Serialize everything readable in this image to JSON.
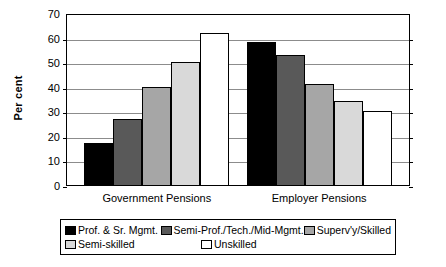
{
  "chart_data": {
    "type": "bar",
    "title": "",
    "xlabel": "",
    "ylabel": "Per cent",
    "ylim": [
      0,
      70
    ],
    "ytick_step": 10,
    "yticks": [
      0,
      10,
      20,
      30,
      40,
      50,
      60,
      70
    ],
    "grid": true,
    "legend_position": "bottom",
    "categories": [
      "Government Pensions",
      "Employer Pensions"
    ],
    "series": [
      {
        "name": "Prof. & Sr. Mgmt.",
        "color": "#000000",
        "values": [
          17,
          58
        ]
      },
      {
        "name": "Semi-Prof./Tech./Mid-Mgmt.",
        "color": "#595959",
        "values": [
          27,
          53
        ]
      },
      {
        "name": "Superv'y/Skilled",
        "color": "#a6a6a6",
        "values": [
          40,
          41
        ]
      },
      {
        "name": "Semi-skilled",
        "color": "#d9d9d9",
        "values": [
          50,
          34
        ]
      },
      {
        "name": "Unskilled",
        "color": "#ffffff",
        "values": [
          62,
          30
        ]
      }
    ]
  },
  "axis": {
    "y_title": "Per cent",
    "tick_labels": [
      "70",
      "60",
      "50",
      "40",
      "30",
      "20",
      "10",
      "0"
    ]
  },
  "x_axis": {
    "labels": [
      "Government Pensions",
      "Employer Pensions"
    ]
  },
  "legend": {
    "items": [
      "Prof. & Sr. Mgmt.",
      "Semi-Prof./Tech./Mid-Mgmt.",
      "Superv'y/Skilled",
      "Semi-skilled",
      "Unskilled"
    ]
  }
}
